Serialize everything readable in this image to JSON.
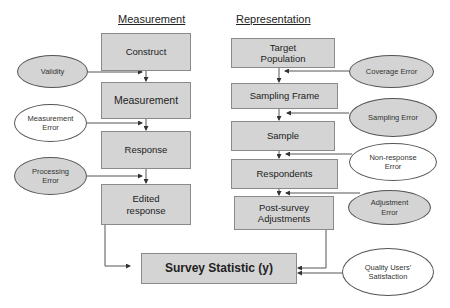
{
  "headings": {
    "measurement": "Measurement",
    "representation": "Representation"
  },
  "measurement_boxes": [
    {
      "label": "Construct"
    },
    {
      "label": "Measurement"
    },
    {
      "label": "Response"
    },
    {
      "label": "Edited response"
    }
  ],
  "representation_boxes": [
    {
      "label": "Target Population"
    },
    {
      "label": "Sampling Frame"
    },
    {
      "label": "Sample"
    },
    {
      "label": "Respondents"
    },
    {
      "label": "Post-survey Adjustments"
    }
  ],
  "result_box": {
    "label": "Survey Statistic (y)"
  },
  "left_errors": [
    {
      "label": "Validity",
      "fill": "grey"
    },
    {
      "label": "Measurement Error",
      "fill": "white"
    },
    {
      "label": "Processing Error",
      "fill": "grey"
    }
  ],
  "right_errors": [
    {
      "label": "Coverage Error",
      "fill": "grey"
    },
    {
      "label": "Sampling Error",
      "fill": "grey"
    },
    {
      "label": "Non-response Error",
      "fill": "white"
    },
    {
      "label": "Adjustment Error",
      "fill": "grey"
    }
  ],
  "quality_ellipse": {
    "label": "Quality Users' Satisfaction",
    "fill": "white"
  },
  "colors": {
    "box_fill": "#d4d4d4",
    "box_border": "#8a8a8a",
    "line": "#555555"
  }
}
